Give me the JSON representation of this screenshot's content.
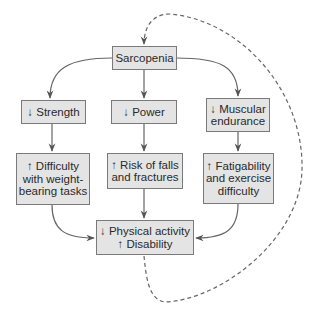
{
  "diagram": {
    "nodes": {
      "sarcopenia": "Sarcopenia",
      "strength": "↓ Strength",
      "power": "↓ Power",
      "endurance": "↓ Muscular\nendurance",
      "difficulty": "↑ Difficulty\nwith weight-\nbearing tasks",
      "falls": "↑ Risk of falls\nand fractures",
      "fatigability": "↑ Fatigability\nand exercise\ndifficulty",
      "outcome": "↓ Physical activity\n↑ Disability"
    },
    "edges": [
      {
        "from": "sarcopenia",
        "to": "strength",
        "style": "solid"
      },
      {
        "from": "sarcopenia",
        "to": "power",
        "style": "solid"
      },
      {
        "from": "sarcopenia",
        "to": "endurance",
        "style": "solid"
      },
      {
        "from": "strength",
        "to": "difficulty",
        "style": "solid"
      },
      {
        "from": "power",
        "to": "falls",
        "style": "solid"
      },
      {
        "from": "endurance",
        "to": "fatigability",
        "style": "solid"
      },
      {
        "from": "difficulty",
        "to": "outcome",
        "style": "solid"
      },
      {
        "from": "falls",
        "to": "outcome",
        "style": "solid"
      },
      {
        "from": "fatigability",
        "to": "outcome",
        "style": "solid"
      },
      {
        "from": "outcome",
        "to": "sarcopenia",
        "style": "dashed"
      }
    ],
    "colors": {
      "box_fill": "#e4e4e4",
      "box_border": "#7a7a7a",
      "line": "#555555"
    }
  }
}
